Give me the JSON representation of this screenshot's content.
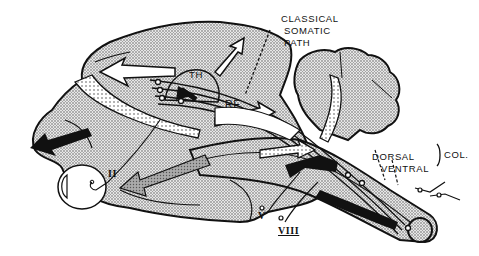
{
  "diagram": {
    "type": "brain-sagittal-schematic",
    "colors": {
      "stipple_fill": "#c8c8c8",
      "outline": "#111111",
      "background": "#ffffff",
      "arrow_black": "#111111",
      "arrow_gray": "#9a9a9a"
    },
    "labels": {
      "classical_somatic_path_line1": "CLASSICAL",
      "classical_somatic_path_line2": "SOMATIC",
      "classical_somatic_path_line3": "PATH",
      "thalamus": "TH",
      "reticular_formation": "RF",
      "dorsal": "DORSAL",
      "ventral": "VENTRAL",
      "columns": "COL.",
      "cranial_nerve_optic": "II",
      "cranial_nerve_trigeminal": "V",
      "cranial_nerve_vestibulocochlear": "VIII"
    },
    "structures": [
      "cerebral-hemisphere",
      "thalamus",
      "reticular-formation",
      "cerebellum",
      "brainstem-spinal-cord",
      "eye",
      "dorsal-column",
      "ventral-column"
    ]
  }
}
